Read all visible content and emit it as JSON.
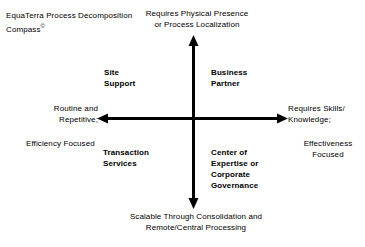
{
  "diagram": {
    "title": "EquaTerra Process Decomposition Compass",
    "title_mark": "©",
    "type": "2x2 quadrant compass",
    "axes": {
      "vertical": {
        "top_label": "Requires Physical Presence\nor Process Localization",
        "bottom_label": "Scalable Through Consolidation and\nRemote/Central Processing"
      },
      "horizontal": {
        "left_label_primary": "Routine and\nRepetitive;",
        "left_label_secondary": "Efficiency Focused",
        "right_label_primary": "Requires Skills/\nKnowledge;",
        "right_label_secondary": "Effectiveness\nFocused"
      }
    },
    "quadrants": [
      {
        "id": "site-support",
        "label": "Site\nSupport",
        "position": "upper-left"
      },
      {
        "id": "business-partner",
        "label": "Business\nPartner",
        "position": "upper-right"
      },
      {
        "id": "transaction-services",
        "label": "Transaction\nServices",
        "position": "lower-left"
      },
      {
        "id": "center-of-expertise",
        "label": "Center of\nExpertise or\nCorporate\nGovernance",
        "position": "lower-right"
      }
    ],
    "colors": {
      "background": "#ffffff",
      "text": "#000000",
      "axis": "#000000"
    }
  }
}
